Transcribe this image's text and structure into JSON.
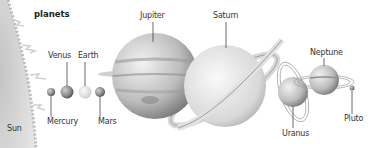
{
  "diagram": {
    "title": "planets",
    "labels": {
      "sun": "Sun",
      "mercury": "Mercury",
      "venus": "Venus",
      "earth": "Earth",
      "mars": "Mars",
      "jupiter": "Jupiter",
      "saturn": "Saturn",
      "uranus": "Uranus",
      "neptune": "Neptune",
      "pluto": "Pluto"
    },
    "colors": {
      "background": "#ffffff",
      "planet_fill": "#c8c8c8",
      "planet_dark": "#7a7a7a",
      "leader_line": "#444444",
      "sun_fill": "#d6d6d6"
    }
  }
}
